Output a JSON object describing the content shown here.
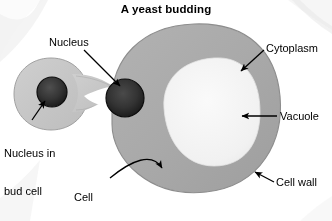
{
  "title": "A yeast budding",
  "labels": {
    "nucleus": "Nucleus",
    "cytoplasm": "Cytoplasm",
    "vacuole": "Vacuole",
    "cell_wall": "Cell wall",
    "nucleus_in_bud_cell_line1": "Nucleus in",
    "nucleus_in_bud_cell_line2": "bud cell",
    "cell_membrane_line1": "Cell",
    "cell_membrane_line2": "membrane"
  },
  "colors": {
    "background": "#ffffff",
    "cytoplasm": "#a9a9a9",
    "cytoplasm_rim": "#8d8d8d",
    "bud_cell": "#c5c5c5",
    "bud_cell_rim": "#a5a5a5",
    "vacuole": "#f2f2f2",
    "nucleus": "#2b2b2b",
    "nucleus_rim": "#111111",
    "label_text": "#000000",
    "leader_line": "#000000",
    "corner_shadow": "#e8e8e8"
  },
  "figure": {
    "organism": "yeast cell",
    "process": "budding",
    "parts": [
      "mother cell",
      "bud cell",
      "nucleus",
      "nucleus in bud cell",
      "vacuole",
      "cytoplasm",
      "cell wall",
      "cell membrane"
    ]
  }
}
